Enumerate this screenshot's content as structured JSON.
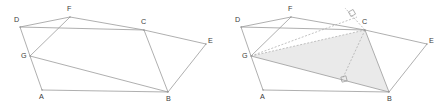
{
  "figure": {
    "panels": [
      {
        "name": "panel-left",
        "caption": "",
        "origin_x": 0,
        "vertices": [
          {
            "label": "D",
            "x": 20,
            "y": 27,
            "label_x": 14,
            "label_y": 22
          },
          {
            "label": "F",
            "x": 70,
            "y": 17,
            "label_x": 67,
            "label_y": 11
          },
          {
            "label": "C",
            "x": 144,
            "y": 30,
            "label_x": 141,
            "label_y": 24
          },
          {
            "label": "E",
            "x": 206,
            "y": 44,
            "label_x": 208,
            "label_y": 43
          },
          {
            "label": "B",
            "x": 168,
            "y": 92,
            "label_x": 166,
            "label_y": 101
          },
          {
            "label": "A",
            "x": 42,
            "y": 90,
            "label_x": 39,
            "label_y": 99
          },
          {
            "label": "G",
            "x": 30,
            "y": 56,
            "label_x": 21,
            "label_y": 58
          }
        ]
      },
      {
        "name": "panel-right",
        "caption": "",
        "origin_x": 221,
        "vertices": [
          {
            "label": "D",
            "x": 241,
            "y": 27,
            "label_x": 235,
            "label_y": 22
          },
          {
            "label": "F",
            "x": 291,
            "y": 17,
            "label_x": 288,
            "label_y": 11
          },
          {
            "label": "C",
            "x": 365,
            "y": 30,
            "label_x": 362,
            "label_y": 24
          },
          {
            "label": "E",
            "x": 427,
            "y": 44,
            "label_x": 429,
            "label_y": 43
          },
          {
            "label": "B",
            "x": 389,
            "y": 92,
            "label_x": 387,
            "label_y": 101
          },
          {
            "label": "A",
            "x": 263,
            "y": 90,
            "label_x": 260,
            "label_y": 99
          },
          {
            "label": "G",
            "x": 251,
            "y": 56,
            "label_x": 242,
            "label_y": 58
          }
        ]
      }
    ],
    "edges_left": [
      {
        "name": "edge-D-F",
        "from": "D",
        "to": "F"
      },
      {
        "name": "edge-F-C",
        "from": "F",
        "to": "C"
      },
      {
        "name": "edge-C-E",
        "from": "C",
        "to": "E"
      },
      {
        "name": "edge-E-B",
        "from": "E",
        "to": "B"
      },
      {
        "name": "edge-B-A",
        "from": "B",
        "to": "A"
      },
      {
        "name": "edge-A-G",
        "from": "A",
        "to": "G"
      },
      {
        "name": "edge-G-D",
        "from": "G",
        "to": "D"
      },
      {
        "name": "edge-D-C",
        "from": "D",
        "to": "C"
      },
      {
        "name": "edge-G-F",
        "from": "G",
        "to": "F"
      },
      {
        "name": "edge-G-B",
        "from": "G",
        "to": "B"
      },
      {
        "name": "edge-C-B",
        "from": "C",
        "to": "B"
      }
    ],
    "edges_right": [
      {
        "name": "edge-D-F",
        "from": "D",
        "to": "F"
      },
      {
        "name": "edge-F-C",
        "from": "F",
        "to": "C"
      },
      {
        "name": "edge-C-E",
        "from": "C",
        "to": "E"
      },
      {
        "name": "edge-E-B",
        "from": "E",
        "to": "B"
      },
      {
        "name": "edge-B-A",
        "from": "B",
        "to": "A"
      },
      {
        "name": "edge-A-G",
        "from": "A",
        "to": "G"
      },
      {
        "name": "edge-G-D",
        "from": "G",
        "to": "D"
      },
      {
        "name": "edge-D-C",
        "from": "D",
        "to": "C"
      },
      {
        "name": "edge-G-F",
        "from": "G",
        "to": "F"
      },
      {
        "name": "edge-G-B",
        "from": "G",
        "to": "B"
      },
      {
        "name": "edge-C-B",
        "from": "C",
        "to": "B"
      }
    ],
    "shaded_triangle": {
      "name": "triangle-G-C-B",
      "points": "251,56 365,30 389,92",
      "fill": "#e9e9e9"
    },
    "dashed_segments": [
      {
        "name": "dashed-G-C",
        "x1": 251,
        "y1": 56,
        "x2": 365,
        "y2": 30
      },
      {
        "name": "dashed-G-to-altitude-top",
        "x1": 251,
        "y1": 56,
        "x2": 357,
        "y2": 17
      },
      {
        "name": "dashed-C-extension",
        "x1": 365,
        "y1": 30,
        "x2": 345,
        "y2": 8
      },
      {
        "name": "dashed-C-altitude-foot",
        "x1": 365,
        "y1": 30,
        "x2": 341,
        "y2": 82
      }
    ],
    "right_angle_marks": [
      {
        "name": "right-angle-mark-at-C-extension",
        "x": 352,
        "y": 13,
        "rotation": -28
      },
      {
        "name": "right-angle-mark-at-altitude-foot",
        "x": 344,
        "y": 79,
        "rotation": -14
      }
    ],
    "colors": {
      "stroke": "#9a9a9a",
      "label": "#3a3a3a",
      "shade": "#e9e9e9",
      "background": "#ffffff"
    }
  }
}
